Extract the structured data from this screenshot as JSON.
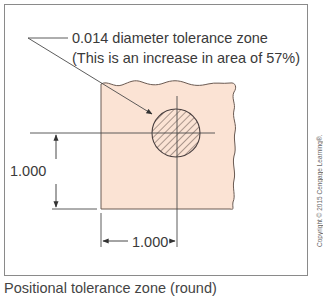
{
  "figure": {
    "callout": {
      "line1": "0.014 diameter tolerance zone",
      "line2": "(This is an increase in area of 57%)"
    },
    "dimensions": {
      "vertical": "1.000",
      "horizontal": "1.000"
    },
    "caption": "Positional tolerance zone (round)",
    "copyright": "Copyright © 2015 Cengage Learning®."
  },
  "colors": {
    "part_fill": "#fbe3d4",
    "line": "#4a4a4a",
    "frame": "#8a8a8a",
    "text": "#3a3a3a"
  }
}
